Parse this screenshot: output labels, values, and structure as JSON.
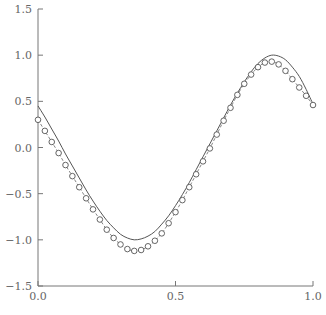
{
  "chart_data": {
    "type": "line",
    "title": "",
    "xlabel": "",
    "ylabel": "",
    "xlim": [
      0.0,
      1.0
    ],
    "ylim": [
      -1.5,
      1.5
    ],
    "grid": false,
    "legend": null,
    "x_ticks": [
      0.0,
      0.5,
      1.0
    ],
    "x_tick_labels": [
      "0.0",
      "0.5",
      "1.0"
    ],
    "y_ticks": [
      -1.5,
      -1.0,
      -0.5,
      0.0,
      0.5,
      1.0,
      1.5
    ],
    "y_tick_labels": [
      "−1.5",
      "−1.0",
      "−0.5",
      "0.0",
      "0.5",
      "1.0",
      "1.5"
    ],
    "series": [
      {
        "name": "true function",
        "style": "solid-line",
        "x": [
          0,
          0.025,
          0.05,
          0.075,
          0.1,
          0.125,
          0.15,
          0.175,
          0.2,
          0.225,
          0.25,
          0.275,
          0.3,
          0.325,
          0.35,
          0.375,
          0.4,
          0.425,
          0.45,
          0.475,
          0.5,
          0.525,
          0.55,
          0.575,
          0.6,
          0.625,
          0.65,
          0.675,
          0.7,
          0.725,
          0.75,
          0.775,
          0.8,
          0.825,
          0.85,
          0.875,
          0.9,
          0.925,
          0.95,
          0.975,
          1.0
        ],
        "y": [
          0.45,
          0.33,
          0.2,
          0.07,
          -0.07,
          -0.2,
          -0.33,
          -0.46,
          -0.58,
          -0.69,
          -0.79,
          -0.87,
          -0.94,
          -0.98,
          -1.0,
          -0.99,
          -0.96,
          -0.91,
          -0.83,
          -0.74,
          -0.63,
          -0.51,
          -0.38,
          -0.24,
          -0.1,
          0.04,
          0.18,
          0.32,
          0.46,
          0.59,
          0.71,
          0.82,
          0.91,
          0.97,
          1.0,
          0.99,
          0.95,
          0.87,
          0.77,
          0.63,
          0.47
        ]
      },
      {
        "name": "fitted points",
        "style": "dashed-line-with-circle-markers",
        "x": [
          0,
          0.025,
          0.05,
          0.075,
          0.1,
          0.125,
          0.15,
          0.175,
          0.2,
          0.225,
          0.25,
          0.275,
          0.3,
          0.325,
          0.35,
          0.375,
          0.4,
          0.425,
          0.45,
          0.475,
          0.5,
          0.525,
          0.55,
          0.575,
          0.6,
          0.625,
          0.65,
          0.675,
          0.7,
          0.725,
          0.75,
          0.775,
          0.8,
          0.825,
          0.85,
          0.875,
          0.9,
          0.925,
          0.95,
          0.975,
          1.0
        ],
        "y": [
          0.3,
          0.18,
          0.06,
          -0.06,
          -0.19,
          -0.31,
          -0.43,
          -0.55,
          -0.67,
          -0.78,
          -0.89,
          -0.98,
          -1.05,
          -1.1,
          -1.12,
          -1.11,
          -1.07,
          -1.01,
          -0.93,
          -0.82,
          -0.7,
          -0.57,
          -0.43,
          -0.29,
          -0.15,
          -0.01,
          0.14,
          0.29,
          0.43,
          0.57,
          0.69,
          0.79,
          0.87,
          0.92,
          0.93,
          0.9,
          0.83,
          0.74,
          0.65,
          0.56,
          0.46
        ]
      }
    ]
  }
}
